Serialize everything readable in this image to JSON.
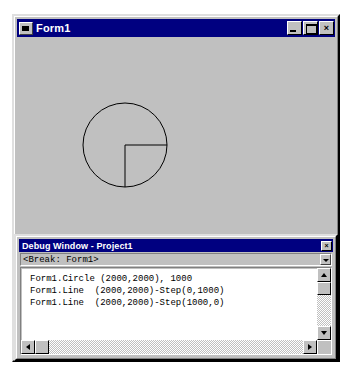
{
  "desktop": {
    "background_color": "#ffffff"
  },
  "form_window": {
    "title": "Form1",
    "icon": "form-window-icon",
    "titlebar_color": "#000080",
    "face_color": "#c0c0c0",
    "buttons": {
      "minimize": {
        "name": "minimize-button",
        "glyph": "_"
      },
      "maximize": {
        "name": "maximize-button",
        "glyph": "□"
      },
      "close": {
        "name": "close-button",
        "glyph": "×"
      }
    },
    "drawing": {
      "description": "circle with two radii forming a lower-right quadrant",
      "stroke_color": "#000000",
      "circle": {
        "cx": 108,
        "cy": 106,
        "r": 42
      },
      "line_vertical": {
        "x1": 108,
        "y1": 106,
        "x2": 108,
        "y2": 148
      },
      "line_horizontal": {
        "x1": 108,
        "y1": 106,
        "x2": 150,
        "y2": 106
      }
    }
  },
  "debug_window": {
    "title": "Debug Window - Project1",
    "close_glyph": "×",
    "context": "<Break: Form1>",
    "code_lines": [
      "Form1.Circle (2000,2000), 1000",
      "Form1.Line  (2000,2000)-Step(0,1000)",
      "Form1.Line  (2000,2000)-Step(1000,0)"
    ],
    "scrollbars": {
      "vertical": {
        "up": "scroll-up-arrow",
        "down": "scroll-down-arrow"
      },
      "horizontal": {
        "left": "scroll-left-arrow",
        "right": "scroll-right-arrow"
      }
    }
  },
  "chart_data": {
    "type": "scatter",
    "x": [
      2000,
      2000,
      3000
    ],
    "y": [
      2000,
      3000,
      2000
    ],
    "annotations": [
      "Circle centered at (2000,2000) radius 1000",
      "Line from (2000,2000) Step(0,1000)",
      "Line from (2000,2000) Step(1000,0)"
    ],
    "xlabel": "",
    "ylabel": "",
    "grid": false,
    "legend": "none"
  }
}
